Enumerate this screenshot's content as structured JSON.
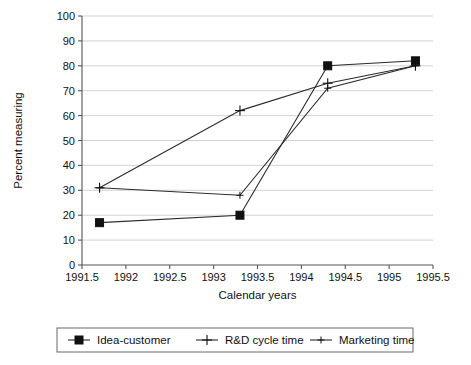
{
  "chart_data": {
    "type": "line",
    "title": "",
    "xlabel": "Calendar years",
    "ylabel": "Percent measuring",
    "xlim": [
      1991.5,
      1995.5
    ],
    "ylim": [
      0,
      100
    ],
    "xticks": [
      1991.5,
      1992,
      1992.5,
      1993,
      1993.5,
      1994,
      1994.5,
      1995,
      1995.5
    ],
    "xtick_labels": [
      "1991.5",
      "1992",
      "1992.5",
      "1993",
      "1993.5",
      "1994",
      "1994.5",
      "1995",
      "1995.5"
    ],
    "yticks": [
      0,
      10,
      20,
      30,
      40,
      50,
      60,
      70,
      80,
      90,
      100
    ],
    "ytick_labels": [
      "0",
      "10",
      "20",
      "30",
      "40",
      "50",
      "60",
      "70",
      "80",
      "90",
      "100"
    ],
    "grid": "horizontal",
    "legend_position": "bottom-outside",
    "x": [
      1991.7,
      1993.3,
      1994.3,
      1995.3
    ],
    "series": [
      {
        "name": "Idea-customer",
        "marker": "filled-square",
        "values": [
          17,
          20,
          80,
          82
        ]
      },
      {
        "name": "R&D cycle time",
        "marker": "plus",
        "values": [
          31,
          62,
          73,
          80
        ]
      },
      {
        "name": "Marketing time",
        "marker": "small-plus",
        "values": [
          31,
          28,
          71,
          80
        ]
      }
    ],
    "line_color": "#2b2b2b",
    "grid_color": "#c8c8c8",
    "axis_color": "#555555",
    "background": "#ffffff"
  }
}
